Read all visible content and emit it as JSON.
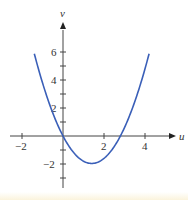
{
  "chart_data": {
    "type": "line",
    "title": "",
    "xlabel": "u",
    "ylabel": "v",
    "xlim": [
      -2.6,
      5.0
    ],
    "ylim": [
      -3.6,
      7.5
    ],
    "x_ticks": [
      -2,
      -1,
      0,
      1,
      2,
      3,
      4
    ],
    "x_tick_labels": [
      "-2",
      "2",
      "4"
    ],
    "y_ticks": [
      -3,
      -2,
      -1,
      1,
      2,
      3,
      4,
      5,
      6
    ],
    "y_tick_labels": [
      "-2",
      "2",
      "4",
      "6"
    ],
    "grid": false,
    "legend": null,
    "series": [
      {
        "name": "parabola",
        "color": "#3a5fb8",
        "u": [
          -1.4,
          -1.0,
          -0.5,
          0,
          0.5,
          1.0,
          1.4,
          2.0,
          2.5,
          2.8,
          3.5,
          4.0,
          4.2
        ],
        "v": [
          5.88,
          3.8,
          1.65,
          0,
          -1.15,
          -1.8,
          -1.96,
          -1.6,
          -0.75,
          0,
          2.45,
          4.8,
          5.88
        ]
      }
    ]
  },
  "labels": {
    "x_axis": "u",
    "y_axis": "v",
    "xt_neg2": "−2",
    "xt_2": "2",
    "xt_4": "4",
    "yt_6": "6",
    "yt_4": "4",
    "yt_2": "2",
    "yt_neg2": "−2"
  }
}
